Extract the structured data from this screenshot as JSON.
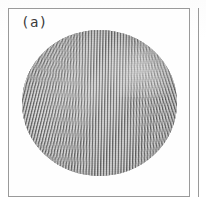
{
  "figure": {
    "panel_label": "(a)",
    "caption_text": "",
    "background_color": "#ffffff",
    "frame_color": "#9a9a9a"
  },
  "panel_a": {
    "label": "(a)",
    "frame": {
      "x": 8,
      "y": 8,
      "width": 182,
      "height": 189,
      "border_color": "#9a9a9a",
      "border_width_px": 1
    }
  },
  "neighbor_panel": {
    "edge_label": "",
    "visible_edge_x": 198,
    "border_color": "#9a9a9a"
  },
  "chart_data": {
    "type": "heatmap",
    "title": "(a)",
    "subtitle": "",
    "xlabel": "",
    "ylabel": "",
    "legend": [],
    "annotations": [
      "circular convection cell",
      "near-vertical roll (stripe) pattern",
      "rolls bend to meet the sidewall perpendicularly",
      "brighter grain-boundary / defect region upper-right"
    ],
    "grid": false,
    "colormap": "grayscale",
    "value_range": [
      0,
      1
    ],
    "cell": {
      "shape": "disk",
      "center_x_px": 90,
      "center_y_px": 102,
      "radius_x_px": 77,
      "radius_y_px": 73
    },
    "pattern": {
      "kind": "straight-roll convection",
      "roll_period_px": 2.9,
      "dominant_orientation_deg": 91,
      "orientation_range_deg": [
        58,
        128
      ],
      "mean_gray": 0.62,
      "contrast": 0.42
    },
    "domains": [
      {
        "name": "core",
        "orientation_deg": 91,
        "center": [
          0.5,
          0.5
        ]
      },
      {
        "name": "left",
        "orientation_deg": 104,
        "center": [
          0.04,
          0.62
        ]
      },
      {
        "name": "right",
        "orientation_deg": 72,
        "center": [
          0.96,
          0.4
        ]
      },
      {
        "name": "top-left",
        "orientation_deg": 118,
        "center": [
          0.16,
          0.16
        ]
      },
      {
        "name": "top-right",
        "orientation_deg": 58,
        "center": [
          0.84,
          0.12
        ]
      },
      {
        "name": "bottom-left",
        "orientation_deg": 128,
        "center": [
          0.14,
          0.88
        ]
      },
      {
        "name": "bottom-right",
        "orientation_deg": 62,
        "center": [
          0.84,
          0.9
        ]
      }
    ]
  }
}
